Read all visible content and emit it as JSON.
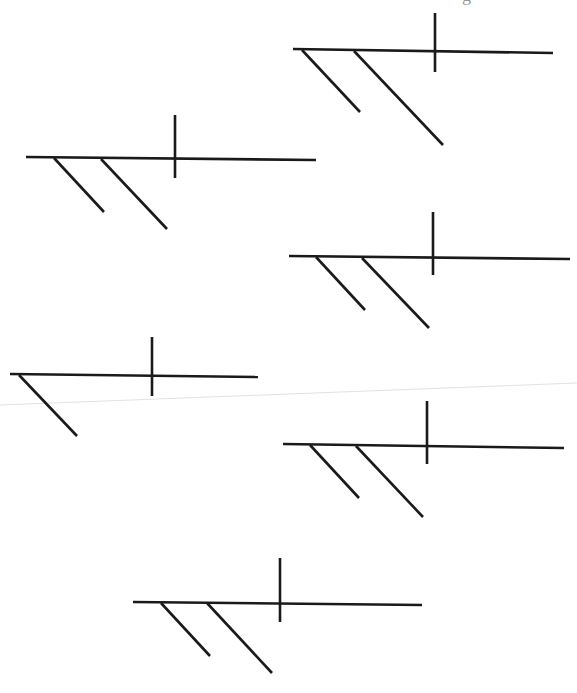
{
  "page": {
    "background": "#ffffff",
    "line_color": "#1a1a1a",
    "line_width": 2.6,
    "artifact_color": "#e2e2e2",
    "top_fragment_text": "g"
  },
  "scan_artifact": {
    "name": "faint-scan-line",
    "x1": 0,
    "y1": 405,
    "x2": 577,
    "y2": 383
  },
  "diagrams": [
    {
      "id": 1,
      "label": "diagram-1",
      "baseline": {
        "x1": 293,
        "y1": 49,
        "x2": 553,
        "y2": 53
      },
      "divider": {
        "x1": 435,
        "y1": 13,
        "x2": 435,
        "y2": 72
      },
      "modifiers": [
        {
          "x1": 302,
          "y1": 50,
          "x2": 360,
          "y2": 112
        },
        {
          "x1": 354,
          "y1": 51,
          "x2": 443,
          "y2": 145
        }
      ]
    },
    {
      "id": 2,
      "label": "diagram-2",
      "baseline": {
        "x1": 26,
        "y1": 157,
        "x2": 316,
        "y2": 160
      },
      "divider": {
        "x1": 175,
        "y1": 115,
        "x2": 175,
        "y2": 178
      },
      "modifiers": [
        {
          "x1": 54,
          "y1": 158,
          "x2": 104,
          "y2": 212
        },
        {
          "x1": 101,
          "y1": 159,
          "x2": 167,
          "y2": 229
        }
      ]
    },
    {
      "id": 3,
      "label": "diagram-3",
      "baseline": {
        "x1": 289,
        "y1": 256,
        "x2": 570,
        "y2": 259
      },
      "divider": {
        "x1": 433,
        "y1": 212,
        "x2": 433,
        "y2": 275
      },
      "modifiers": [
        {
          "x1": 316,
          "y1": 257,
          "x2": 365,
          "y2": 310
        },
        {
          "x1": 362,
          "y1": 258,
          "x2": 429,
          "y2": 328
        }
      ]
    },
    {
      "id": 4,
      "label": "diagram-4",
      "baseline": {
        "x1": 10,
        "y1": 374,
        "x2": 258,
        "y2": 377
      },
      "divider": {
        "x1": 152,
        "y1": 337,
        "x2": 152,
        "y2": 396
      },
      "modifiers": [
        {
          "x1": 19,
          "y1": 375,
          "x2": 77,
          "y2": 436
        }
      ]
    },
    {
      "id": 5,
      "label": "diagram-5",
      "baseline": {
        "x1": 283,
        "y1": 444,
        "x2": 564,
        "y2": 448
      },
      "divider": {
        "x1": 427,
        "y1": 401,
        "x2": 427,
        "y2": 464
      },
      "modifiers": [
        {
          "x1": 310,
          "y1": 445,
          "x2": 359,
          "y2": 498
        },
        {
          "x1": 356,
          "y1": 446,
          "x2": 423,
          "y2": 517
        }
      ]
    },
    {
      "id": 6,
      "label": "diagram-6",
      "baseline": {
        "x1": 133,
        "y1": 602,
        "x2": 422,
        "y2": 605
      },
      "divider": {
        "x1": 280,
        "y1": 558,
        "x2": 280,
        "y2": 622
      },
      "modifiers": [
        {
          "x1": 161,
          "y1": 603,
          "x2": 210,
          "y2": 656
        },
        {
          "x1": 207,
          "y1": 603,
          "x2": 272,
          "y2": 673
        }
      ]
    }
  ]
}
